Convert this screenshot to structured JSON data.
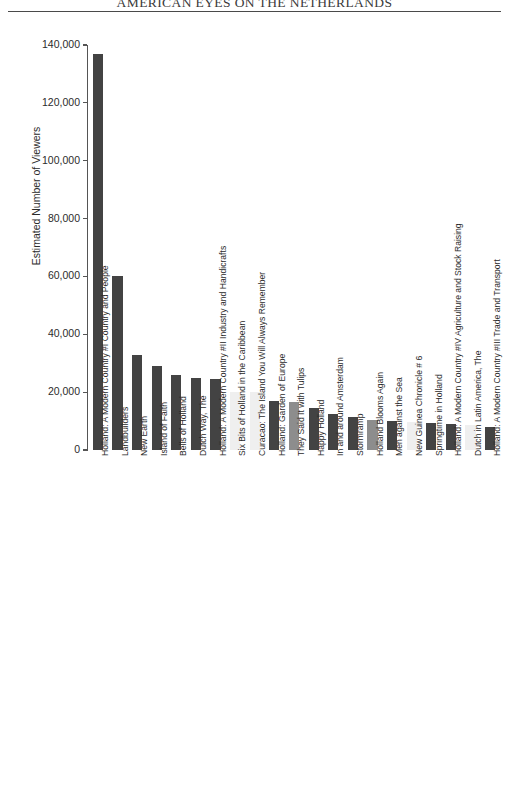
{
  "running_head": {
    "text": "AMERICAN EYES ON THE NETHERLANDS"
  },
  "chart_data": {
    "type": "bar",
    "title": "",
    "xlabel": "",
    "ylabel": "Estimated Number of Viewers",
    "ylim": [
      0,
      140000
    ],
    "ytick_labels": [
      "140,000",
      "120,000",
      "100,000",
      "80,000",
      "60,000",
      "40,000",
      "20,000",
      "0"
    ],
    "ytick_values": [
      140000,
      120000,
      100000,
      80000,
      60000,
      40000,
      20000,
      0
    ],
    "grid": false,
    "legend": "none",
    "bar_colors": {
      "dark": "#434343",
      "medium": "#8d8d8d",
      "light": "#efefef"
    },
    "categories": [
      "Holland: A Modern Country #I Country and People",
      "Landbuilders",
      "New Earth",
      "Island of Faith",
      "Bells of Holland",
      "Dutch Way, The",
      "Holland: A Modern Country #II Industry and Handicrafts",
      "Six Bits of Holland in the Caribbean",
      "Curacao: The Island You Will Always Remember",
      "Holland: Garden of Europe",
      "They Said It with Tulips",
      "Happy Holland",
      "In and around Amsterdam",
      "Stormramp",
      "Holland Blooms Again",
      "Men against the Sea",
      "New Guinea Chronicle # 6",
      "Springtime in Holland",
      "Holland: A Modern Country #IV Agriculture and Stock Raising",
      "Dutch in Latin America, The",
      "Holland: A Modern Country #III Trade and Transport"
    ],
    "values": [
      137000,
      60000,
      33000,
      29000,
      26000,
      25000,
      24500,
      20000,
      20000,
      17000,
      16500,
      14500,
      12500,
      11500,
      10500,
      10000,
      9800,
      9500,
      9000,
      8800,
      8000
    ],
    "shades": [
      "dark",
      "dark",
      "dark",
      "dark",
      "dark",
      "dark",
      "dark",
      "light",
      "light",
      "dark",
      "medium",
      "dark",
      "dark",
      "dark",
      "medium",
      "dark",
      "light",
      "dark",
      "dark",
      "light",
      "dark"
    ]
  }
}
